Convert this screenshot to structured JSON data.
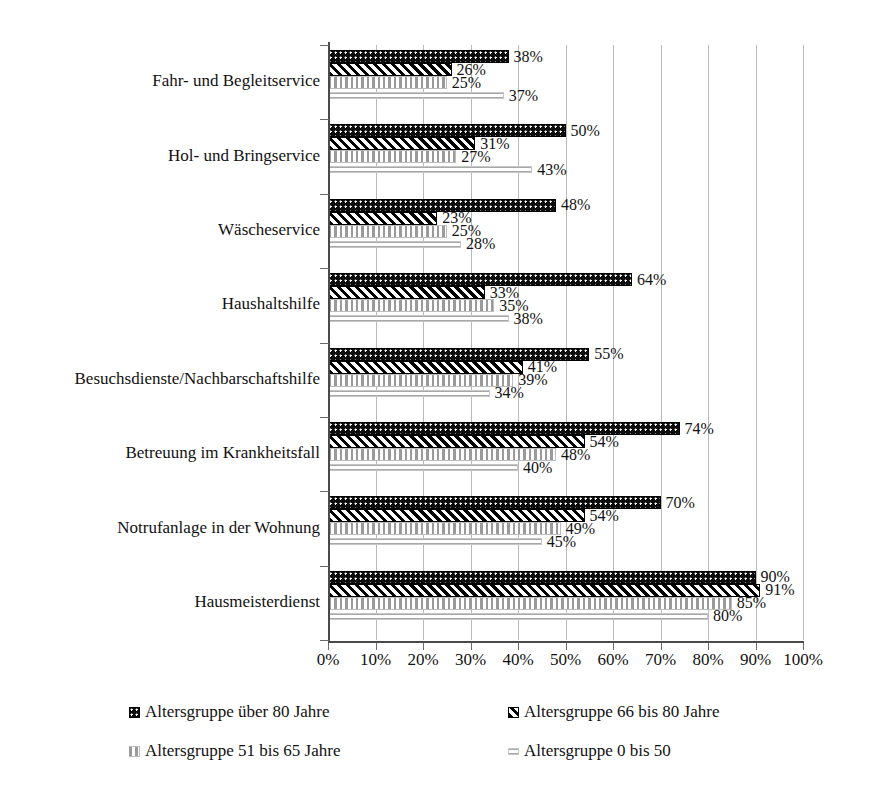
{
  "chart_data": {
    "type": "bar",
    "orientation": "horizontal",
    "title": "",
    "xlabel": "",
    "ylabel": "",
    "xlim": [
      0,
      100
    ],
    "xticks": [
      "0%",
      "10%",
      "20%",
      "30%",
      "40%",
      "50%",
      "60%",
      "70%",
      "80%",
      "90%",
      "100%"
    ],
    "grid": "vertical",
    "legend_position": "bottom",
    "value_suffix": "%",
    "categories": [
      "Fahr- und Begleitservice",
      "Hol- und Bringservice",
      "Wäscheservice",
      "Haushaltshilfe",
      "Besuchsdienste/Nachbarschaftshilfe",
      "Betreuung im Krankheitsfall",
      "Notrufanlage in der Wohnung",
      "Hausmeisterdienst"
    ],
    "series": [
      {
        "name": "Altersgruppe über 80 Jahre",
        "pattern": "dots",
        "color": "#0d0d0d",
        "values": [
          38,
          50,
          48,
          64,
          55,
          74,
          70,
          90
        ],
        "labels": [
          "38%",
          "50%",
          "48%",
          "64%",
          "55%",
          "74%",
          "70%",
          "90%"
        ]
      },
      {
        "name": "Altersgruppe 66 bis 80 Jahre",
        "pattern": "diagonal",
        "color": "#000000",
        "values": [
          26,
          31,
          23,
          33,
          41,
          54,
          54,
          91
        ],
        "labels": [
          "26%",
          "31%",
          "23%",
          "33%",
          "41%",
          "54%",
          "54%",
          "91%"
        ]
      },
      {
        "name": "Altersgruppe 51 bis 65 Jahre",
        "pattern": "vertical",
        "color": "#9a9a9a",
        "values": [
          25,
          27,
          25,
          35,
          39,
          48,
          49,
          85
        ],
        "labels": [
          "25%",
          "27%",
          "25%",
          "35%",
          "39%",
          "48%",
          "49%",
          "85%"
        ]
      },
      {
        "name": "Altersgruppe 0 bis 50",
        "pattern": "horizontal",
        "color": "#a8a8a8",
        "values": [
          37,
          43,
          28,
          38,
          34,
          40,
          45,
          80
        ],
        "labels": [
          "37%",
          "43%",
          "28%",
          "38%",
          "34%",
          "40%",
          "45%",
          "80%"
        ]
      }
    ]
  },
  "legend": {
    "items": [
      {
        "label": "Altersgruppe über 80 Jahre",
        "swatch": "dots"
      },
      {
        "label": "Altersgruppe 66 bis 80 Jahre",
        "swatch": "diagonal"
      },
      {
        "label": "Altersgruppe 51 bis 65 Jahre",
        "swatch": "vertical"
      },
      {
        "label": "Altersgruppe 0 bis 50",
        "swatch": "horizontal"
      }
    ]
  }
}
